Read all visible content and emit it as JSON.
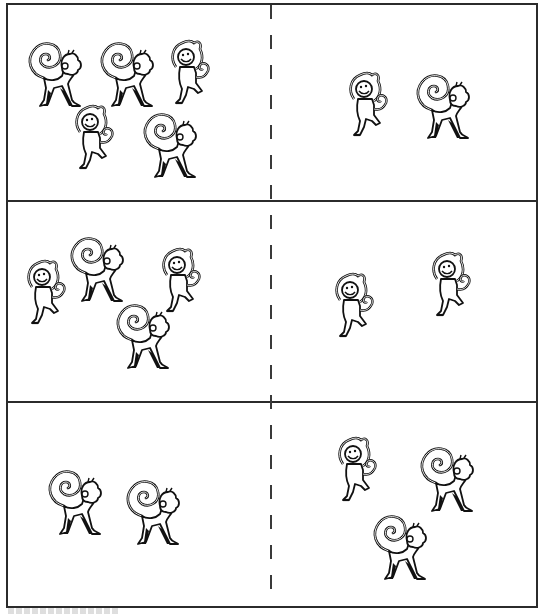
{
  "document": {
    "type": "counting comparison worksheet",
    "colors": {
      "border": "#2b2b2b",
      "ink": "#111111",
      "paper": "#ffffff"
    },
    "rows": [
      {
        "left": {
          "count": 5,
          "monkeys": [
            {
              "pose": "walking",
              "x": 22,
              "y": 38
            },
            {
              "pose": "walking",
              "x": 94,
              "y": 38
            },
            {
              "pose": "dancing",
              "x": 166,
              "y": 37
            },
            {
              "pose": "dancing",
              "x": 70,
              "y": 102
            },
            {
              "pose": "walking",
              "x": 137,
              "y": 109
            }
          ]
        },
        "right": {
          "count": 2,
          "monkeys": [
            {
              "pose": "dancing",
              "x": 344,
              "y": 69
            },
            {
              "pose": "walking",
              "x": 410,
              "y": 70
            }
          ]
        }
      },
      {
        "left": {
          "count": 4,
          "monkeys": [
            {
              "pose": "dancing",
              "x": 22,
              "y": 257
            },
            {
              "pose": "walking",
              "x": 64,
              "y": 233
            },
            {
              "pose": "walking",
              "x": 110,
              "y": 300
            },
            {
              "pose": "dancing",
              "x": 157,
              "y": 245
            }
          ]
        },
        "right": {
          "count": 2,
          "monkeys": [
            {
              "pose": "dancing",
              "x": 330,
              "y": 270
            },
            {
              "pose": "dancing",
              "x": 427,
              "y": 249
            }
          ]
        }
      },
      {
        "left": {
          "count": 2,
          "monkeys": [
            {
              "pose": "walking",
              "x": 42,
              "y": 466
            },
            {
              "pose": "walking",
              "x": 120,
              "y": 476
            }
          ]
        },
        "right": {
          "count": 3,
          "monkeys": [
            {
              "pose": "dancing",
              "x": 333,
              "y": 434
            },
            {
              "pose": "walking",
              "x": 414,
              "y": 443
            },
            {
              "pose": "walking",
              "x": 367,
              "y": 511
            }
          ]
        }
      }
    ],
    "icons": {
      "walking": "monkey-walking-icon",
      "dancing": "monkey-dancing-icon"
    }
  }
}
